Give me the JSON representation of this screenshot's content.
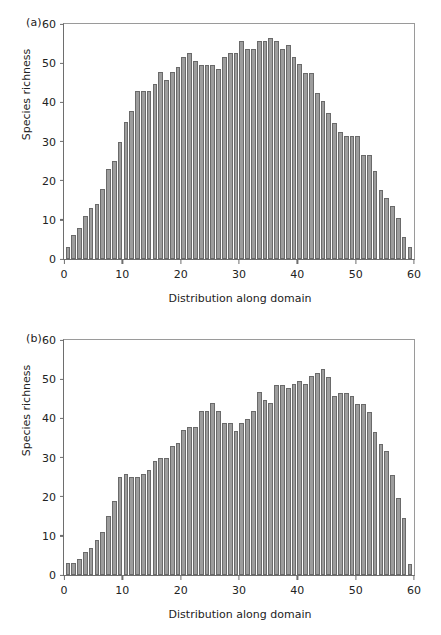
{
  "figure": {
    "background": "#ffffff",
    "bar_color": "#9d9d9d",
    "bar_edge_color": "#6a6a6a",
    "axis_color": "#6e6e6e"
  },
  "panels": [
    {
      "tag": "(a)",
      "ylabel": "Species richness",
      "xlabel": "Distribution along domain"
    },
    {
      "tag": "(b)",
      "ylabel": "Species richness",
      "xlabel": "Distribution along domain"
    }
  ],
  "axes": {
    "yticks": [
      "0",
      "10",
      "20",
      "30",
      "40",
      "50",
      "60"
    ],
    "ytick_values": [
      0,
      10,
      20,
      30,
      40,
      50,
      60
    ],
    "xticks": [
      "0",
      "10",
      "20",
      "30",
      "40",
      "50",
      "60"
    ],
    "xtick_values": [
      0,
      10,
      20,
      30,
      40,
      50,
      60
    ]
  },
  "chart_data": [
    {
      "type": "bar",
      "panel": "(a)",
      "title": "",
      "xlabel": "Distribution along domain",
      "ylabel": "Species richness",
      "xlim": [
        0,
        60
      ],
      "ylim": [
        0,
        60
      ],
      "grid": false,
      "legend": null,
      "categories": [
        1,
        2,
        3,
        4,
        5,
        6,
        7,
        8,
        9,
        10,
        11,
        12,
        13,
        14,
        15,
        16,
        17,
        18,
        19,
        20,
        21,
        22,
        23,
        24,
        25,
        26,
        27,
        28,
        29,
        30,
        31,
        32,
        33,
        34,
        35,
        36,
        37,
        38,
        39,
        40,
        41,
        42,
        43,
        44,
        45,
        46,
        47,
        48,
        49,
        50,
        51,
        52,
        53,
        54,
        55,
        56,
        57,
        58,
        59,
        60
      ],
      "values": [
        3.0,
        6.1,
        8.0,
        11.0,
        13.0,
        14.0,
        18.0,
        23.0,
        25.0,
        30.0,
        34.9,
        37.8,
        42.8,
        42.8,
        42.8,
        44.8,
        47.8,
        45.8,
        47.8,
        48.9,
        51.6,
        52.6,
        50.6,
        49.6,
        49.6,
        49.6,
        48.6,
        51.7,
        52.7,
        52.7,
        55.6,
        53.7,
        53.7,
        55.6,
        55.6,
        56.5,
        55.6,
        53.7,
        54.7,
        51.6,
        49.7,
        47.5,
        47.5,
        42.5,
        40.4,
        37.4,
        34.6,
        32.5,
        31.4,
        31.4,
        31.4,
        26.5,
        26.5,
        22.4,
        17.6,
        15.5,
        13.5,
        10.5,
        5.5,
        3.0
      ]
    },
    {
      "type": "bar",
      "panel": "(b)",
      "title": "",
      "xlabel": "Distribution along domain",
      "ylabel": "Species richness",
      "xlim": [
        0,
        60
      ],
      "ylim": [
        0,
        60
      ],
      "grid": false,
      "legend": null,
      "categories": [
        1,
        2,
        3,
        4,
        5,
        6,
        7,
        8,
        9,
        10,
        11,
        12,
        13,
        14,
        15,
        16,
        17,
        18,
        19,
        20,
        21,
        22,
        23,
        24,
        25,
        26,
        27,
        28,
        29,
        30,
        31,
        32,
        33,
        34,
        35,
        36,
        37,
        38,
        39,
        40,
        41,
        42,
        43,
        44,
        45,
        46,
        47,
        48,
        49,
        50,
        51,
        52,
        53,
        54,
        55,
        56,
        57,
        58,
        59,
        60
      ],
      "values": [
        3.1,
        3.0,
        4.0,
        6.0,
        7.0,
        9.0,
        11.0,
        15.0,
        19.0,
        24.9,
        25.8,
        24.9,
        24.9,
        25.8,
        26.8,
        29.0,
        30.0,
        30.0,
        32.9,
        33.8,
        37.0,
        37.8,
        37.8,
        41.9,
        41.9,
        43.8,
        41.9,
        38.7,
        38.9,
        36.8,
        38.8,
        39.8,
        41.8,
        46.7,
        44.7,
        43.9,
        48.6,
        48.6,
        47.7,
        48.7,
        49.6,
        48.8,
        50.7,
        51.6,
        52.6,
        50.6,
        45.6,
        46.5,
        46.5,
        45.6,
        43.6,
        43.6,
        41.7,
        36.6,
        33.5,
        31.6,
        25.6,
        19.6,
        14.5,
        2.8
      ]
    }
  ],
  "watermarks": [
    "",
    ""
  ]
}
